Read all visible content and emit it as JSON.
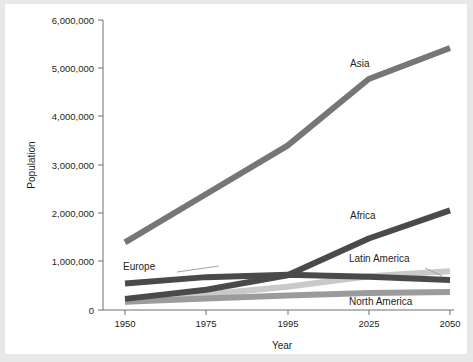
{
  "chart_data": {
    "type": "line",
    "title": "",
    "xlabel": "Year",
    "ylabel": "Population",
    "x": [
      1950,
      1975,
      1995,
      2025,
      2050
    ],
    "xtick_labels": [
      "1950",
      "1975",
      "1995",
      "2025",
      "2050"
    ],
    "ytick_labels": [
      "0",
      "1,000,000",
      "2,000,000",
      "3,000,000",
      "4,000,000",
      "5,000,000",
      "6,000,000"
    ],
    "ytick_values": [
      0,
      1000000,
      2000000,
      3000000,
      4000000,
      5000000,
      6000000
    ],
    "ylim": [
      0,
      6000000
    ],
    "grid": false,
    "legend_position": "inline-labels",
    "series": [
      {
        "name": "Asia",
        "color": "#767676",
        "values": [
          1400000,
          2400000,
          3400000,
          4780000,
          5420000
        ]
      },
      {
        "name": "Africa",
        "color": "#4a4a4a",
        "values": [
          230000,
          420000,
          720000,
          1480000,
          2060000
        ]
      },
      {
        "name": "Europe",
        "color": "#4a4a4a",
        "values": [
          550000,
          680000,
          730000,
          690000,
          620000
        ]
      },
      {
        "name": "Latin America",
        "color": "#c9c9c9",
        "values": [
          170000,
          320000,
          480000,
          700000,
          800000
        ]
      },
      {
        "name": "North America",
        "color": "#9b9b9b",
        "values": [
          170000,
          240000,
          300000,
          350000,
          370000
        ]
      }
    ]
  },
  "axes": {
    "y_title": "Population",
    "x_title": "Year",
    "y_labels": [
      "6,000,000",
      "5,000,000",
      "4,000,000",
      "3,000,000",
      "2,000,000",
      "1,000,000",
      "0"
    ],
    "x_labels": [
      "1950",
      "1975",
      "1995",
      "2025",
      "2050"
    ]
  },
  "series_labels": {
    "asia": "Asia",
    "africa": "Africa",
    "europe": "Europe",
    "latin_america": "Latin America",
    "north_america": "North America"
  },
  "colors": {
    "asia": "#767676",
    "africa": "#4a4a4a",
    "europe": "#4a4a4a",
    "latin_america": "#c9c9c9",
    "north_america": "#9b9b9b",
    "axis": "#6d6e71",
    "text": "#231f20",
    "background": "#ffffff",
    "frame": "#e8e8e8"
  }
}
